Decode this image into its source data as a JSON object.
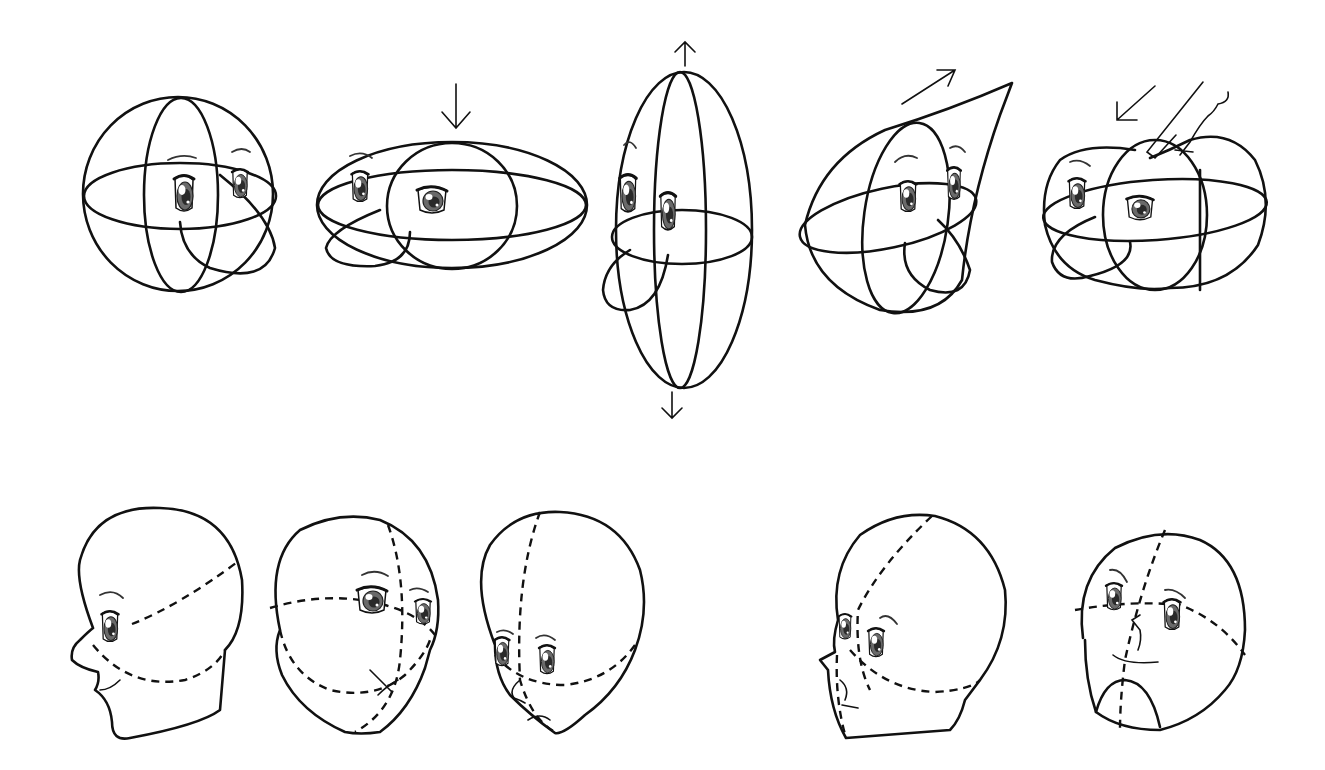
{
  "figure": {
    "title": "",
    "background": "#ffffff",
    "line_color": "#111111",
    "iris_color": "#6a6a6a",
    "rows": [
      {
        "name": "sphere-deformations",
        "panels": [
          {
            "id": "basic-sphere",
            "arrow": "none"
          },
          {
            "id": "squashed-sphere",
            "arrow": "down"
          },
          {
            "id": "stretched-sphere",
            "arrow": "up-and-down"
          },
          {
            "id": "pulled-sphere",
            "arrow": "up-right"
          },
          {
            "id": "pressed-sphere",
            "arrow": "down-left",
            "extra": "hand-pushing"
          }
        ]
      },
      {
        "name": "head-constructions",
        "panels": [
          {
            "id": "profile-left-head"
          },
          {
            "id": "three-quarter-down-head"
          },
          {
            "id": "looking-up-head"
          },
          {
            "id": "three-quarter-up-profile-head"
          },
          {
            "id": "foreshortened-front-head"
          }
        ]
      }
    ]
  }
}
